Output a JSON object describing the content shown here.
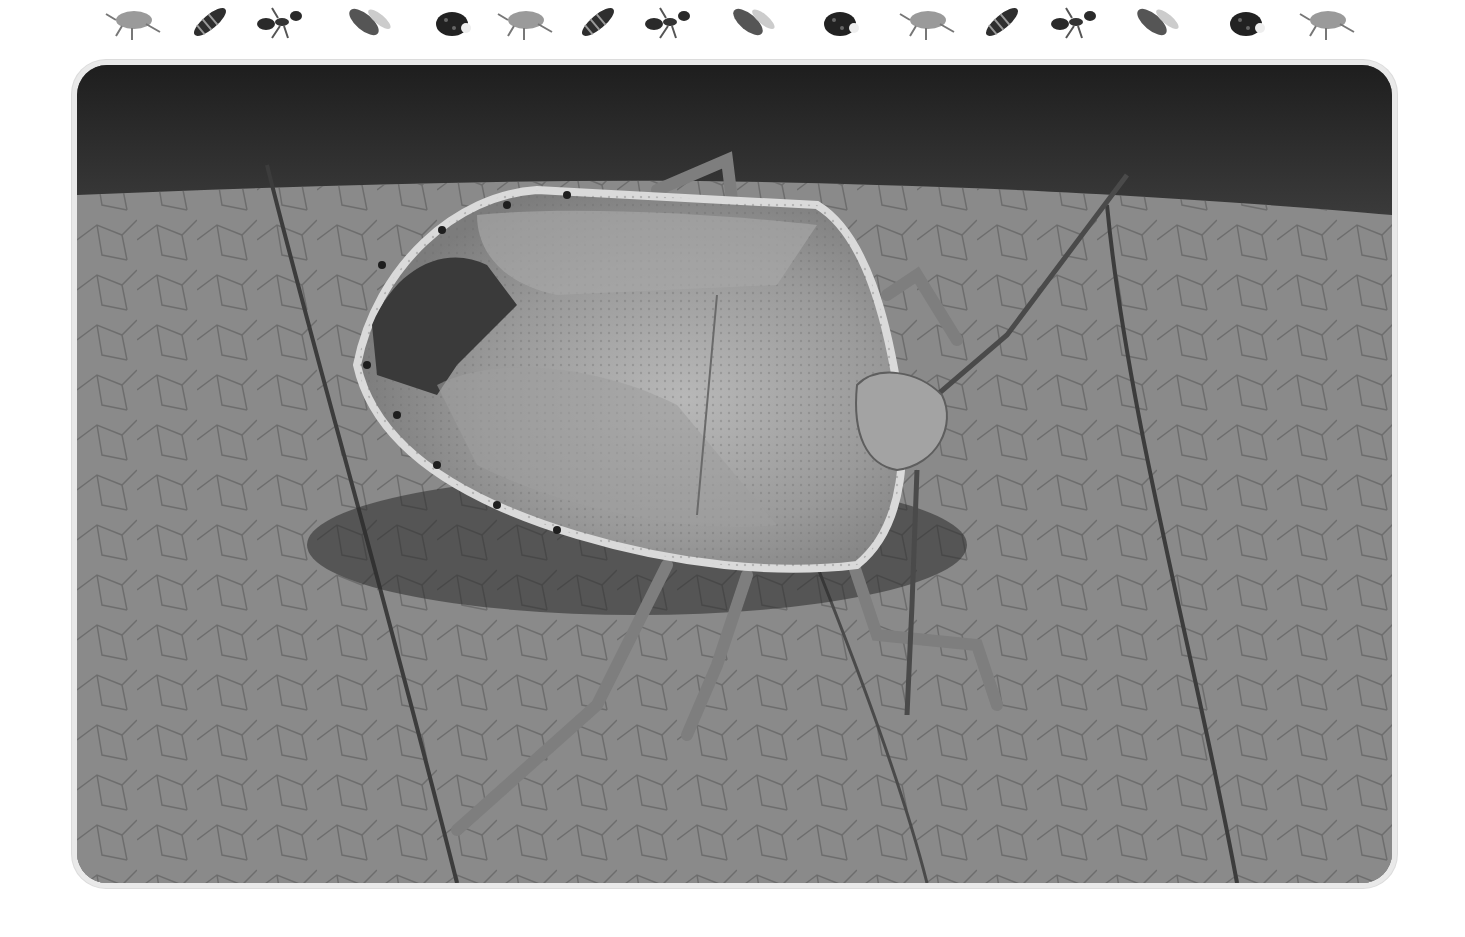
{
  "decorative_border": {
    "insects": [
      "beetle",
      "wasp",
      "ant",
      "bee",
      "ladybug",
      "beetle",
      "wasp",
      "ant",
      "bee",
      "ladybug",
      "beetle",
      "wasp",
      "ant",
      "bee",
      "ladybug",
      "beetle"
    ],
    "positions_x": [
      102,
      180,
      252,
      334,
      424,
      494,
      568,
      640,
      718,
      812,
      896,
      972,
      1046,
      1122,
      1218,
      1296
    ]
  },
  "photo": {
    "subject": "shield bug on dry leaf",
    "style": "grayscale",
    "colors": {
      "background_dark": "#2b2b2b",
      "leaf": "#8f8f8f",
      "bug_body": "#9c9c9c",
      "bug_dark_patch": "#3a3a3a",
      "frame_border": "#e9e9e9"
    }
  }
}
